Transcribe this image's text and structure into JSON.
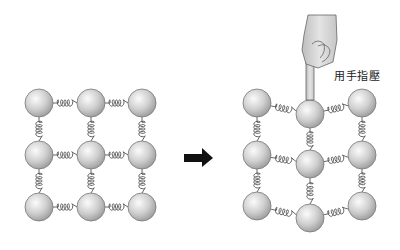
{
  "diagram": {
    "label": "用手指壓",
    "arrow_color": "#111111",
    "ball_fill": "#cccccc",
    "left_grid": {
      "name": "relaxed lattice",
      "balls": [
        [
          39,
          103
        ],
        [
          91,
          103
        ],
        [
          142,
          103
        ],
        [
          39,
          155
        ],
        [
          91,
          155
        ],
        [
          142,
          155
        ],
        [
          39,
          207
        ],
        [
          91,
          207
        ],
        [
          142,
          207
        ]
      ]
    },
    "right_grid": {
      "name": "compressed lattice",
      "balls": [
        [
          257,
          103
        ],
        [
          310,
          114
        ],
        [
          362,
          103
        ],
        [
          257,
          155
        ],
        [
          310,
          164
        ],
        [
          362,
          155
        ],
        [
          257,
          206
        ],
        [
          310,
          218
        ],
        [
          362,
          206
        ]
      ]
    }
  }
}
